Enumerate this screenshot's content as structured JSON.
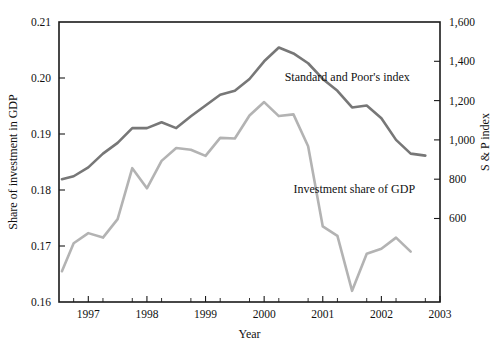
{
  "chart_data": {
    "type": "line",
    "title": "",
    "xlabel": "Year",
    "ylabel_left": "Share of investment in GDP",
    "ylabel_right": "S & P index",
    "grid": false,
    "legend_position": "inline-annotation",
    "xlim": [
      1996.5,
      2003.0
    ],
    "x_ticks_major": [
      1997,
      1998,
      1999,
      2000,
      2001,
      2002,
      2003
    ],
    "x_tick_labels": [
      "1997",
      "1998",
      "1999",
      "2000",
      "2001",
      "2002",
      "2003"
    ],
    "x_ticks_minor": [
      1996.75,
      1997.25,
      1997.75,
      1998.25,
      1998.75,
      1999.25,
      1999.75,
      2000.25,
      2000.75,
      2001.25,
      2001.75,
      2002.25,
      2002.75
    ],
    "ylim_left": [
      0.16,
      0.21
    ],
    "y_ticks_left": [
      0.16,
      0.17,
      0.18,
      0.19,
      0.2,
      0.21
    ],
    "y_tick_labels_left": [
      "0.16",
      "0.17",
      "0.18",
      "0.19",
      "0.20",
      "0.21"
    ],
    "ylim_right": [
      175,
      1600
    ],
    "y_ticks_right": [
      600,
      800,
      1000,
      1200,
      1400,
      1600
    ],
    "y_tick_labels_right": [
      "600",
      "800",
      "1,000",
      "1,200",
      "1,400",
      "1,600"
    ],
    "series": [
      {
        "name": "Standard and Poor's index",
        "axis": "right",
        "color": "#777777",
        "annotation": "Standard and Poor's index",
        "annotation_x": 2000.35,
        "annotation_y": 1300,
        "x": [
          1996.55,
          1996.75,
          1997.0,
          1997.25,
          1997.5,
          1997.75,
          1998.0,
          1998.25,
          1998.5,
          1998.75,
          1999.0,
          1999.25,
          1999.5,
          1999.75,
          2000.0,
          2000.25,
          2000.5,
          2000.75,
          2001.0,
          2001.25,
          2001.5,
          2001.75,
          2002.0,
          2002.25,
          2002.5,
          2002.75
        ],
        "y": [
          800,
          815,
          860,
          930,
          985,
          1060,
          1060,
          1090,
          1060,
          1120,
          1175,
          1230,
          1250,
          1310,
          1400,
          1470,
          1440,
          1390,
          1310,
          1250,
          1165,
          1175,
          1110,
          1000,
          930,
          920
        ],
        "values_note": "S&P 500 index level, semiannual/quarterly observations"
      },
      {
        "name": "Investment share of GDP",
        "axis": "left",
        "color": "#b3b3b3",
        "annotation": "Investment share of GDP",
        "annotation_x": 2000.5,
        "annotation_y": 0.1795,
        "x": [
          1996.55,
          1996.75,
          1997.0,
          1997.25,
          1997.5,
          1997.75,
          1998.0,
          1998.25,
          1998.5,
          1998.75,
          1999.0,
          1999.25,
          1999.5,
          1999.75,
          2000.0,
          2000.25,
          2000.5,
          2000.75,
          2001.0,
          2001.25,
          2001.5,
          2001.75,
          2002.0,
          2002.25,
          2002.5
        ],
        "y": [
          0.1655,
          0.1705,
          0.1723,
          0.1715,
          0.1748,
          0.1839,
          0.1803,
          0.1852,
          0.1875,
          0.1872,
          0.1861,
          0.1893,
          0.1892,
          0.1933,
          0.1957,
          0.1932,
          0.1935,
          0.1878,
          0.1735,
          0.1718,
          0.162,
          0.1686,
          0.1695,
          0.1715,
          0.169
        ],
        "values_note": "Investment share of GDP, fraction"
      }
    ]
  },
  "geometry": {
    "plot_left": 59,
    "plot_right": 440,
    "plot_top": 22,
    "plot_bottom": 302
  }
}
